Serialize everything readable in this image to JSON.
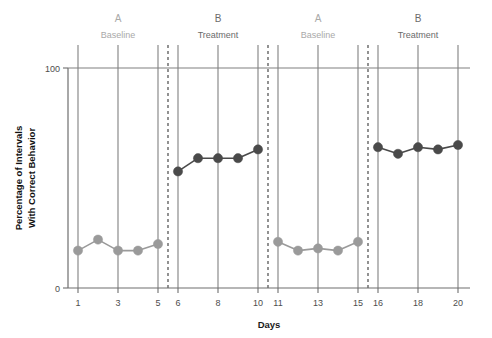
{
  "chart_data": {
    "type": "line",
    "title": "",
    "subtitle": "",
    "xlabel": "Days",
    "ylabel": "Percentage of Intervals With Correct Behavior",
    "ylabel_lines": [
      "Percentage of Intervals",
      "With Correct Behavior"
    ],
    "ylim": [
      0,
      100
    ],
    "xlim": [
      0.4,
      20.6
    ],
    "ytick_labels": [
      "0",
      "100"
    ],
    "ytick_values": [
      0,
      100
    ],
    "xtick_labels": [
      "1",
      "3",
      "5",
      "6",
      "8",
      "10",
      "11",
      "13",
      "15",
      "16",
      "18",
      "20"
    ],
    "xtick_values": [
      1,
      3,
      5,
      6,
      8,
      10,
      11,
      13,
      15,
      16,
      18,
      20
    ],
    "grid": "vertical-at-labeled-days",
    "legend": "none",
    "design": "ABAB reversal",
    "phase_divider_days": [
      5.5,
      10.5,
      15.5
    ],
    "phases": [
      {
        "id": "phase-1",
        "letter": "A",
        "name": "Baseline",
        "days": [
          1,
          5
        ],
        "label_day": 3,
        "color": "#a9a9a9"
      },
      {
        "id": "phase-2",
        "letter": "B",
        "name": "Treatment",
        "days": [
          6,
          10
        ],
        "label_day": 8,
        "color": "#6b6b6b"
      },
      {
        "id": "phase-3",
        "letter": "A",
        "name": "Baseline",
        "days": [
          11,
          15
        ],
        "label_day": 13,
        "color": "#a9a9a9"
      },
      {
        "id": "phase-4",
        "letter": "B",
        "name": "Treatment",
        "days": [
          16,
          20
        ],
        "label_day": 18,
        "color": "#6b6b6b"
      }
    ],
    "series": [
      {
        "name": "Baseline 1",
        "phase": "A",
        "color": "#9a9a9a",
        "x": [
          1,
          2,
          3,
          4,
          5
        ],
        "values": [
          17,
          22,
          17,
          17,
          20
        ]
      },
      {
        "name": "Treatment 1",
        "phase": "B",
        "color": "#4a4a4a",
        "x": [
          6,
          7,
          8,
          9,
          10
        ],
        "values": [
          53,
          59,
          59,
          59,
          63
        ]
      },
      {
        "name": "Baseline 2",
        "phase": "A",
        "color": "#9a9a9a",
        "x": [
          11,
          12,
          13,
          14,
          15
        ],
        "values": [
          21,
          17,
          18,
          17,
          21
        ]
      },
      {
        "name": "Treatment 2",
        "phase": "B",
        "color": "#4a4a4a",
        "x": [
          16,
          17,
          18,
          19,
          20
        ],
        "values": [
          64,
          61,
          64,
          63,
          65
        ]
      }
    ]
  }
}
